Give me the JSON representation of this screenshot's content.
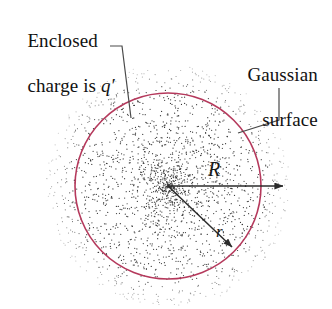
{
  "figure": {
    "background_color": "#ffffff",
    "width": 332,
    "height": 309
  },
  "annotations": {
    "enclosed_charge": {
      "line1": "Enclosed",
      "line2_prefix": "charge is ",
      "line2_symbol": "q′",
      "full_text": "Enclosed charge is q′"
    },
    "gaussian_surface": {
      "line1": "Gaussian",
      "line2": "surface",
      "full_text": "Gaussian surface"
    }
  },
  "math_labels": {
    "radius_outer": "R",
    "radius_inner": "r"
  },
  "geometry": {
    "center": {
      "x": 168,
      "y": 186
    },
    "gaussian_circle": {
      "radius": 93,
      "stroke_color": "#b5395c",
      "stroke_width": 1.6,
      "fill": "none"
    },
    "charge_cloud": {
      "radius": 122,
      "dot_color": "#3a3a3a",
      "dot_count": 2100,
      "density_profile": "increases toward center"
    },
    "arrow_R": {
      "from": {
        "x": 168,
        "y": 186
      },
      "to": {
        "x": 292,
        "y": 186
      },
      "color": "#2b2b2b",
      "crosses_circle": true
    },
    "arrow_r": {
      "from": {
        "x": 168,
        "y": 186
      },
      "to": {
        "x": 238,
        "y": 253
      },
      "color": "#2b2b2b",
      "crosses_circle": false
    },
    "leader_enclosed": {
      "points": [
        [
          110,
          46
        ],
        [
          122,
          46
        ],
        [
          131,
          118
        ]
      ],
      "color": "#4a4a4a"
    },
    "leader_gaussian": {
      "points": [
        [
          279,
          88
        ],
        [
          279,
          120
        ],
        [
          238,
          133
        ]
      ],
      "color": "#4a4a4a"
    }
  },
  "colors": {
    "circle": "#b5395c",
    "dots": "#3a3a3a",
    "arrows": "#2b2b2b",
    "leaders": "#4a4a4a",
    "text": "#111111",
    "background": "#ffffff"
  }
}
